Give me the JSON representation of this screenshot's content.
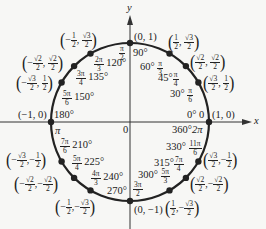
{
  "diagram": {
    "axes": {
      "x_label": "x",
      "y_label": "y",
      "origin_label": "0"
    },
    "colors": {
      "circle": "#222222",
      "axis": "#333333",
      "point": "#222222",
      "background": "#f7f7f5"
    },
    "points": [
      {
        "deg": "0°",
        "rad": "0",
        "coord": "(1, 0)"
      },
      {
        "deg": "30°",
        "rad": "π/6",
        "coord": "(√3/2, 1/2)"
      },
      {
        "deg": "45°",
        "rad": "π/4",
        "coord": "(√2/2, √2/2)"
      },
      {
        "deg": "60°",
        "rad": "π/3",
        "coord": "(1/2, √3/2)"
      },
      {
        "deg": "90°",
        "rad": "π/2",
        "coord": "(0, 1)"
      },
      {
        "deg": "120°",
        "rad": "2π/3",
        "coord": "(−1/2, √3/2)"
      },
      {
        "deg": "135°",
        "rad": "3π/4",
        "coord": "(−√2/2, √2/2)"
      },
      {
        "deg": "150°",
        "rad": "5π/6",
        "coord": "(−√3/2, 1/2)"
      },
      {
        "deg": "180°",
        "rad": "π",
        "coord": "(−1, 0)"
      },
      {
        "deg": "210°",
        "rad": "7π/6",
        "coord": "(−√3/2, −1/2)"
      },
      {
        "deg": "225°",
        "rad": "5π/4",
        "coord": "(−√2/2, −√2/2)"
      },
      {
        "deg": "240°",
        "rad": "4π/3",
        "coord": "(−1/2, −√3/2)"
      },
      {
        "deg": "270°",
        "rad": "3π/2",
        "coord": "(0, −1)"
      },
      {
        "deg": "300°",
        "rad": "5π/3",
        "coord": "(1/2, −√3/2)"
      },
      {
        "deg": "315°",
        "rad": "7π/4",
        "coord": "(√2/2, −√2/2)"
      },
      {
        "deg": "330°",
        "rad": "11π/6",
        "coord": "(√3/2, −1/2)"
      },
      {
        "deg": "360°",
        "rad": "2π",
        "coord": "(1, 0)"
      }
    ],
    "text": {
      "x": "x",
      "y": "y",
      "zero": "0",
      "d0": "0°",
      "r0": "0",
      "c0": "(1, 0)",
      "d360": "360°",
      "r360": "2π",
      "d30": "30°",
      "d45": "45°",
      "d60": "60°",
      "d90": "90°",
      "d120": "120°",
      "d135": "135°",
      "d150": "150°",
      "d180": "180°",
      "d210": "210°",
      "d225": "225°",
      "d240": "240°",
      "d270": "270°",
      "d300": "300°",
      "d315": "315°",
      "d330": "330°",
      "c90": "(0, 1)",
      "c180": "(−1, 0)",
      "c270": "(0, −1)",
      "pi": "π",
      "minus": "−",
      "comma": ",",
      "lp": "(",
      "rp": ")",
      "one": "1",
      "two": "2",
      "rt3": "√3",
      "rt2": "√2",
      "pi_n": "π",
      "n2pi": "2π",
      "n3pi": "3π",
      "n4pi": "4π",
      "n5pi": "5π",
      "n7pi": "7π",
      "n11pi": "11π",
      "den2": "2",
      "den3": "3",
      "den4": "4",
      "den6": "6"
    }
  }
}
